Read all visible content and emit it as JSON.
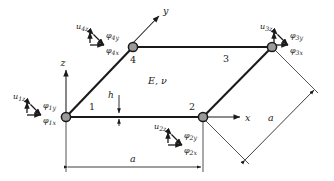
{
  "figure": {
    "type": "finite-element-plate-diagram",
    "material_label": "E, ν",
    "thickness_label": "h",
    "colors": {
      "background": "#ffffff",
      "line": "#1a1a1a",
      "node_fill": "#9a9a9a",
      "node_stroke": "#1a1a1a",
      "text": "#1a1a1a"
    }
  },
  "axes": [
    {
      "name": "x-axis",
      "label": "x"
    },
    {
      "name": "y-axis",
      "label": "y"
    },
    {
      "name": "z-axis",
      "label": "z"
    }
  ],
  "nodes": [
    {
      "id": "1",
      "label": "1",
      "dofs": {
        "uz": "u",
        "uz_sub": "1z",
        "phiy": "φ",
        "phiy_sub": "1y",
        "phix": "φ",
        "phix_sub": "1x"
      }
    },
    {
      "id": "2",
      "label": "2",
      "dofs": {
        "uz": "u",
        "uz_sub": "2z",
        "phiy": "φ",
        "phiy_sub": "2y",
        "phix": "φ",
        "phix_sub": "2x"
      }
    },
    {
      "id": "3",
      "label": "3",
      "dofs": {
        "uz": "u",
        "uz_sub": "3z",
        "phiy": "φ",
        "phiy_sub": "3y",
        "phix": "φ",
        "phix_sub": "3x"
      }
    },
    {
      "id": "4",
      "label": "4",
      "dofs": {
        "uz": "u",
        "uz_sub": "4z",
        "phiy": "φ",
        "phiy_sub": "4y",
        "phix": "φ",
        "phix_sub": "4x"
      }
    }
  ],
  "edge_labels": [
    {
      "name": "edge-label-1",
      "text": "1"
    },
    {
      "name": "edge-label-2",
      "text": "2"
    },
    {
      "name": "edge-label-3",
      "text": "3"
    }
  ],
  "dimensions": [
    {
      "name": "dimension-a-horizontal",
      "label": "a"
    },
    {
      "name": "dimension-a-diagonal",
      "label": "a"
    }
  ]
}
